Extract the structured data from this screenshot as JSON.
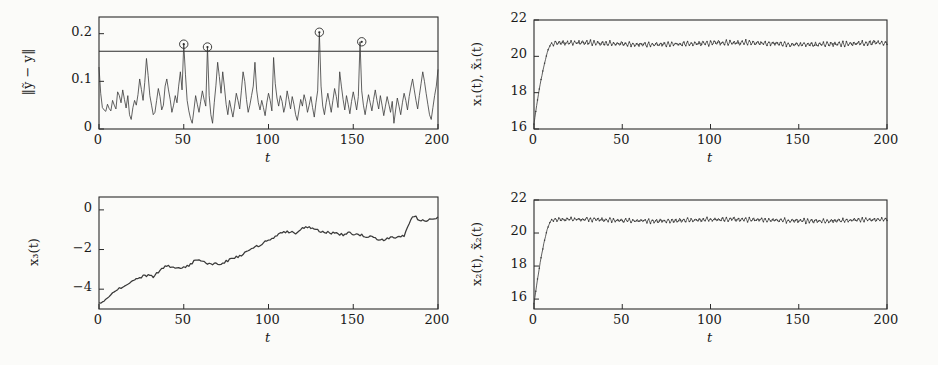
{
  "figure": {
    "background": "#fbfbf9",
    "line_color": "#3a3a3a",
    "axis_color": "#2b2b2b",
    "panel_count": 4
  },
  "panels": [
    {
      "id": "residual-norm",
      "position": "top-left",
      "ylabel": "‖ỹ − y‖",
      "xlabel": "t",
      "yticks": [
        "0",
        "0.1",
        "0.2"
      ],
      "xticks": [
        "0",
        "50",
        "100",
        "150",
        "200"
      ],
      "threshold_label": "0.163"
    },
    {
      "id": "state-x1",
      "position": "top-right",
      "ylabel": "x₁(t), x̃₁(t)",
      "xlabel": "t",
      "yticks": [
        "16",
        "18",
        "20",
        "22"
      ],
      "xticks": [
        "0",
        "50",
        "100",
        "150",
        "200"
      ]
    },
    {
      "id": "state-x3",
      "position": "bottom-left",
      "ylabel": "x₃(t)",
      "xlabel": "t",
      "yticks": [
        "−4",
        "−2",
        "0"
      ],
      "xticks": [
        "0",
        "50",
        "100",
        "150",
        "200"
      ]
    },
    {
      "id": "state-x2",
      "position": "bottom-right",
      "ylabel": "x₂(t), x̃₂(t)",
      "xlabel": "t",
      "yticks": [
        "16",
        "18",
        "20",
        "22"
      ],
      "xticks": [
        "0",
        "50",
        "100",
        "150",
        "200"
      ]
    }
  ],
  "chart_data": [
    {
      "type": "line",
      "id": "residual-norm",
      "title": "",
      "xlabel": "t",
      "ylabel": "||ytilde - y||",
      "xlim": [
        0,
        200
      ],
      "ylim": [
        0,
        0.235
      ],
      "yticks": [
        0,
        0.1,
        0.2
      ],
      "xticks": [
        0,
        50,
        100,
        150,
        200
      ],
      "grid": false,
      "legend": "none",
      "threshold": 0.163,
      "alarm_markers": [
        {
          "x": 50,
          "y": 0.178
        },
        {
          "x": 64,
          "y": 0.172
        },
        {
          "x": 130,
          "y": 0.203
        },
        {
          "x": 155,
          "y": 0.183
        }
      ],
      "x": [
        0,
        1,
        2,
        3,
        4,
        5,
        6,
        7,
        8,
        9,
        10,
        11,
        12,
        13,
        14,
        15,
        16,
        17,
        18,
        19,
        20,
        21,
        22,
        23,
        24,
        25,
        26,
        27,
        28,
        29,
        30,
        31,
        32,
        33,
        34,
        35,
        36,
        37,
        38,
        39,
        40,
        41,
        42,
        43,
        44,
        45,
        46,
        47,
        48,
        49,
        50,
        51,
        52,
        53,
        54,
        55,
        56,
        57,
        58,
        59,
        60,
        61,
        62,
        63,
        64,
        65,
        66,
        67,
        68,
        69,
        70,
        71,
        72,
        73,
        74,
        75,
        76,
        77,
        78,
        79,
        80,
        81,
        82,
        83,
        84,
        85,
        86,
        87,
        88,
        89,
        90,
        91,
        92,
        93,
        94,
        95,
        96,
        97,
        98,
        99,
        100,
        101,
        102,
        103,
        104,
        105,
        106,
        107,
        108,
        109,
        110,
        111,
        112,
        113,
        114,
        115,
        116,
        117,
        118,
        119,
        120,
        121,
        122,
        123,
        124,
        125,
        126,
        127,
        128,
        129,
        130,
        131,
        132,
        133,
        134,
        135,
        136,
        137,
        138,
        139,
        140,
        141,
        142,
        143,
        144,
        145,
        146,
        147,
        148,
        149,
        150,
        151,
        152,
        153,
        154,
        155,
        156,
        157,
        158,
        159,
        160,
        161,
        162,
        163,
        164,
        165,
        166,
        167,
        168,
        169,
        170,
        171,
        172,
        173,
        174,
        175,
        176,
        177,
        178,
        179,
        180,
        181,
        182,
        183,
        184,
        185,
        186,
        187,
        188,
        189,
        190,
        191,
        192,
        193,
        194,
        195,
        196,
        197,
        198,
        199,
        200
      ],
      "values": [
        0.13,
        0.075,
        0.045,
        0.04,
        0.037,
        0.052,
        0.043,
        0.038,
        0.06,
        0.05,
        0.042,
        0.078,
        0.07,
        0.055,
        0.082,
        0.062,
        0.044,
        0.07,
        0.03,
        0.02,
        0.045,
        0.06,
        0.05,
        0.072,
        0.105,
        0.083,
        0.06,
        0.098,
        0.148,
        0.112,
        0.07,
        0.05,
        0.03,
        0.035,
        0.06,
        0.085,
        0.068,
        0.04,
        0.05,
        0.09,
        0.105,
        0.082,
        0.062,
        0.035,
        0.05,
        0.07,
        0.055,
        0.09,
        0.12,
        0.082,
        0.178,
        0.115,
        0.06,
        0.038,
        0.022,
        0.012,
        0.04,
        0.07,
        0.052,
        0.035,
        0.058,
        0.08,
        0.062,
        0.048,
        0.172,
        0.07,
        0.03,
        0.012,
        0.055,
        0.092,
        0.14,
        0.11,
        0.075,
        0.12,
        0.088,
        0.052,
        0.03,
        0.06,
        0.042,
        0.025,
        0.048,
        0.075,
        0.06,
        0.042,
        0.08,
        0.12,
        0.1,
        0.062,
        0.035,
        0.05,
        0.07,
        0.09,
        0.14,
        0.082,
        0.055,
        0.04,
        0.06,
        0.045,
        0.028,
        0.055,
        0.075,
        0.06,
        0.038,
        0.15,
        0.095,
        0.065,
        0.048,
        0.07,
        0.058,
        0.035,
        0.05,
        0.08,
        0.062,
        0.042,
        0.068,
        0.052,
        0.03,
        0.018,
        0.04,
        0.062,
        0.048,
        0.072,
        0.058,
        0.035,
        0.05,
        0.068,
        0.045,
        0.025,
        0.055,
        0.08,
        0.203,
        0.09,
        0.048,
        0.03,
        0.055,
        0.075,
        0.055,
        0.035,
        0.06,
        0.085,
        0.068,
        0.045,
        0.12,
        0.09,
        0.062,
        0.04,
        0.07,
        0.052,
        0.032,
        0.058,
        0.078,
        0.06,
        0.04,
        0.068,
        0.183,
        0.08,
        0.05,
        0.03,
        0.052,
        0.072,
        0.055,
        0.038,
        0.062,
        0.082,
        0.06,
        0.042,
        0.07,
        0.05,
        0.028,
        0.048,
        0.068,
        0.052,
        0.035,
        0.058,
        0.012,
        0.04,
        0.065,
        0.048,
        0.03,
        0.055,
        0.075,
        0.06,
        0.04,
        0.068,
        0.088,
        0.105,
        0.082,
        0.06,
        0.042,
        0.07,
        0.095,
        0.12,
        0.1,
        0.075,
        0.052,
        0.03,
        0.02,
        0.045,
        0.07,
        0.09,
        0.125,
        0.14,
        0.11,
        0.08,
        0.095
      ]
    },
    {
      "type": "line",
      "id": "state-x1",
      "title": "",
      "xlabel": "t",
      "ylabel": "x1(t), x1tilde(t)",
      "xlim": [
        0,
        200
      ],
      "ylim": [
        16,
        22
      ],
      "yticks": [
        16,
        18,
        20,
        22
      ],
      "xticks": [
        0,
        50,
        100,
        150,
        200
      ],
      "grid": false,
      "legend": "none",
      "description": "rises from 16.3 to plateau at 20.7 by t=10, then dense sawtooth oscillation amplitude 0.25",
      "rise": {
        "start_value": 16.3,
        "plateau_value": 20.7,
        "rise_end_t": 10
      },
      "oscillation": {
        "mean": 20.7,
        "amplitude": 0.25,
        "period": 2.2,
        "noise": 0.05
      }
    },
    {
      "type": "line",
      "id": "state-x3",
      "title": "",
      "xlabel": "t",
      "ylabel": "x3(t)",
      "xlim": [
        0,
        200
      ],
      "ylim": [
        -5.0,
        0.65
      ],
      "yticks": [
        -4,
        -2,
        0
      ],
      "xticks": [
        0,
        50,
        100,
        150,
        200
      ],
      "grid": false,
      "legend": "none",
      "x": [
        0,
        4,
        8,
        12,
        16,
        20,
        24,
        28,
        32,
        36,
        40,
        44,
        48,
        52,
        56,
        60,
        64,
        68,
        72,
        76,
        80,
        84,
        88,
        92,
        96,
        100,
        104,
        108,
        112,
        116,
        120,
        124,
        128,
        132,
        136,
        140,
        144,
        148,
        152,
        156,
        160,
        164,
        168,
        172,
        176,
        180,
        184,
        186,
        188,
        192,
        196,
        200
      ],
      "values": [
        -4.7,
        -4.55,
        -4.2,
        -3.95,
        -3.8,
        -3.55,
        -3.4,
        -3.3,
        -3.35,
        -3.05,
        -2.8,
        -2.9,
        -2.95,
        -2.85,
        -2.6,
        -2.55,
        -2.7,
        -2.72,
        -2.75,
        -2.55,
        -2.4,
        -2.3,
        -2.05,
        -1.9,
        -1.7,
        -1.55,
        -1.35,
        -1.15,
        -1.1,
        -1.15,
        -0.95,
        -0.85,
        -1.0,
        -1.1,
        -1.15,
        -1.2,
        -1.25,
        -1.15,
        -1.25,
        -1.3,
        -1.35,
        -1.45,
        -1.55,
        -1.35,
        -1.4,
        -1.3,
        -0.45,
        -0.3,
        -0.45,
        -0.55,
        -0.5,
        -0.35
      ]
    },
    {
      "type": "line",
      "id": "state-x2",
      "title": "",
      "xlabel": "t",
      "ylabel": "x2(t), x2tilde(t)",
      "xlim": [
        0,
        200
      ],
      "ylim": [
        15.4,
        22
      ],
      "yticks": [
        16,
        18,
        20,
        22
      ],
      "xticks": [
        0,
        50,
        100,
        150,
        200
      ],
      "grid": false,
      "legend": "none",
      "description": "rises from 15.7 to plateau at 20.8 by t=10, then dense sawtooth oscillation amplitude 0.22",
      "rise": {
        "start_value": 15.7,
        "plateau_value": 20.8,
        "rise_end_t": 10
      },
      "oscillation": {
        "mean": 20.78,
        "amplitude": 0.22,
        "period": 2.2,
        "noise": 0.05
      }
    }
  ]
}
